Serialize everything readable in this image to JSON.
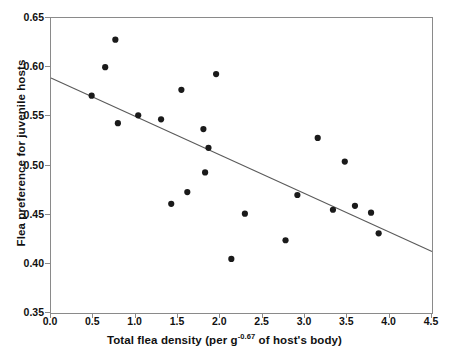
{
  "chart_data": {
    "type": "scatter",
    "title": "",
    "xlabel": "Total flea density (per g-0.67 of host's body)",
    "xlabel_prefix": "Total flea density (per g",
    "xlabel_exponent": "-0.67",
    "xlabel_suffix": " of host's body)",
    "ylabel": "Flea preference for juvenile hosts",
    "xlim": [
      0.0,
      4.5
    ],
    "ylim": [
      0.35,
      0.65
    ],
    "xticks": [
      "0.0",
      "0.5",
      "1.0",
      "1.5",
      "2.0",
      "2.5",
      "3.0",
      "3.5",
      "4.0",
      "4.5"
    ],
    "xtick_values": [
      0.0,
      0.5,
      1.0,
      1.5,
      2.0,
      2.5,
      3.0,
      3.5,
      4.0,
      4.5
    ],
    "yticks": [
      "0.35",
      "0.40",
      "0.45",
      "0.50",
      "0.55",
      "0.60",
      "0.65"
    ],
    "ytick_values": [
      0.35,
      0.4,
      0.45,
      0.5,
      0.55,
      0.6,
      0.65
    ],
    "grid": false,
    "legend": false,
    "marker_color": "#1a1a1a",
    "marker_size": 5,
    "line_color": "#5a5a5a",
    "frame_color": "#8a8a8a",
    "points": [
      {
        "x": 0.48,
        "y": 0.571
      },
      {
        "x": 0.64,
        "y": 0.6
      },
      {
        "x": 0.76,
        "y": 0.628
      },
      {
        "x": 0.79,
        "y": 0.543
      },
      {
        "x": 1.03,
        "y": 0.551
      },
      {
        "x": 1.3,
        "y": 0.547
      },
      {
        "x": 1.42,
        "y": 0.461
      },
      {
        "x": 1.54,
        "y": 0.577
      },
      {
        "x": 1.61,
        "y": 0.473
      },
      {
        "x": 1.8,
        "y": 0.537
      },
      {
        "x": 1.82,
        "y": 0.493
      },
      {
        "x": 1.86,
        "y": 0.518
      },
      {
        "x": 1.95,
        "y": 0.593
      },
      {
        "x": 2.13,
        "y": 0.405
      },
      {
        "x": 2.29,
        "y": 0.451
      },
      {
        "x": 2.77,
        "y": 0.424
      },
      {
        "x": 2.91,
        "y": 0.47
      },
      {
        "x": 3.15,
        "y": 0.528
      },
      {
        "x": 3.33,
        "y": 0.455
      },
      {
        "x": 3.47,
        "y": 0.504
      },
      {
        "x": 3.59,
        "y": 0.459
      },
      {
        "x": 3.78,
        "y": 0.452
      },
      {
        "x": 3.87,
        "y": 0.431
      }
    ],
    "trendline": {
      "x0": 0.0,
      "y0": 0.589,
      "x1": 4.5,
      "y1": 0.4125
    }
  }
}
